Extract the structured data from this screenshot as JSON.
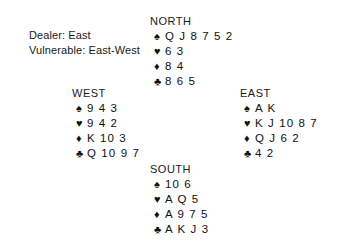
{
  "diagram": {
    "background": "#ffffff",
    "text_color": "#1a1a1a"
  },
  "conditions": {
    "dealer_line": "Dealer: East",
    "vulnerable_line": "Vulnerable: East-West",
    "dealer": "East",
    "vulnerable": "East-West"
  },
  "suit_symbols": {
    "spade": "♠",
    "heart": "♥",
    "diamond": "♦",
    "club": "♣"
  },
  "hands": {
    "north": {
      "label": "NORTH",
      "spades": "Q J 8 7 5 2",
      "hearts": "6 3",
      "diamonds": "8 4",
      "clubs": "8 6 5"
    },
    "west": {
      "label": "WEST",
      "spades": "9 4 3",
      "hearts": "9 4 2",
      "diamonds": "K 10 3",
      "clubs": "Q 10 9 7"
    },
    "east": {
      "label": "EAST",
      "spades": "A K",
      "hearts": "K J 10 8 7",
      "diamonds": "Q J 6 2",
      "clubs": "4 2"
    },
    "south": {
      "label": "SOUTH",
      "spades": "10 6",
      "hearts": "A Q 5",
      "diamonds": "A 9 7 5",
      "clubs": "A K J 3"
    }
  }
}
